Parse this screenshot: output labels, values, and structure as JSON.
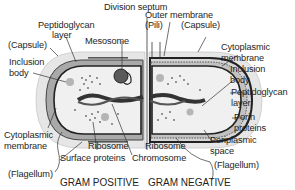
{
  "diagram": {
    "title_left": "GRAM POSITIVE",
    "title_right": "GRAM NEGATIVE",
    "colors": {
      "capsule": "#e6e6e6",
      "peptidoglycan_gp": "#a9a9a9",
      "cytoplasm": "#f0f0f0",
      "membrane": "#2a2a2a",
      "leader_line": "#333333"
    },
    "top_label": "Division septum",
    "left_labels": {
      "peptidoglycan": "Peptidoglycan",
      "layer": "layer",
      "capsule": "(Capsule)",
      "mesosome": "Mesosome",
      "inclusion": "Inclusion",
      "body": "body",
      "cytoplasmic": "Cytoplasmic",
      "membrane": "membrane",
      "flagellum": "(Flagellum)",
      "ribosome": "Ribosome",
      "surface_proteins": "Surface proteins",
      "chromosome": "Chromosome"
    },
    "right_labels": {
      "outer_membrane": "Outer membrane",
      "pili": "(Pili)",
      "capsule": "(Capsule)",
      "cytoplasmic": "Cytoplasmic",
      "membrane": "membrane",
      "inclusion": "Inclusion",
      "body": "body",
      "peptidoglycan": "Peptidoglycan",
      "layer": "layer",
      "porin": "Porin",
      "proteins": "proteins",
      "periplasmic": "Periplasmic",
      "space": "space",
      "ribosome": "Ribosome",
      "flagellum": "(Flagellum)"
    }
  }
}
